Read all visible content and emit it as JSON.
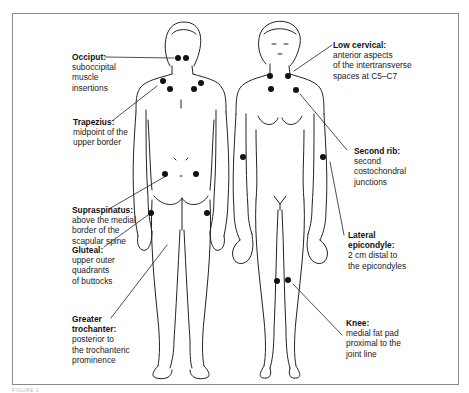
{
  "figure": {
    "caption": "FIGURE 1",
    "views": [
      "posterior",
      "anterior"
    ],
    "accent_color": "#111111",
    "frame_color": "#8a8a8a"
  },
  "labels": {
    "occiput": {
      "title": "Occiput:",
      "lines": [
        "suboccipital",
        "muscle",
        "insertions"
      ]
    },
    "trapezius": {
      "title": "Trapezius:",
      "lines": [
        "midpoint of the",
        "upper border"
      ]
    },
    "supraspinatus": {
      "title": "Supraspinatus:",
      "lines": [
        "above the medial",
        "border of the",
        "scapular spine"
      ]
    },
    "gluteal": {
      "title": "Gluteal:",
      "lines": [
        "upper outer",
        "quadrants",
        "of buttocks"
      ]
    },
    "greater_trochanter": {
      "title": "Greater trochanter:",
      "title_lines": [
        "Greater",
        "trochanter:"
      ],
      "lines": [
        "posterior to",
        "the trochanteric",
        "prominence"
      ]
    },
    "low_cervical": {
      "title": "Low cervical:",
      "lines": [
        "anterior aspects",
        "of the intertransverse",
        "spaces at C5–C7"
      ]
    },
    "second_rib": {
      "title": "Second rib:",
      "lines": [
        "second",
        "costochondral",
        "junctions"
      ]
    },
    "lateral_epicondyle": {
      "title": "Lateral epicondyle:",
      "title_lines": [
        "Lateral",
        "epicondyle:"
      ],
      "lines": [
        "2 cm distal to",
        "the epicondyles"
      ]
    },
    "knee": {
      "title": "Knee:",
      "lines": [
        "medial fat pad",
        "proximal  to the",
        "joint line"
      ]
    }
  },
  "tender_points": {
    "posterior": [
      {
        "name": "occiput-left",
        "x": 178,
        "y": 58
      },
      {
        "name": "occiput-right",
        "x": 186,
        "y": 58
      },
      {
        "name": "trapezius-left",
        "x": 163,
        "y": 81
      },
      {
        "name": "trapezius-right",
        "x": 201,
        "y": 83
      },
      {
        "name": "supraspinatus-left",
        "x": 170,
        "y": 89
      },
      {
        "name": "supraspinatus-right",
        "x": 194,
        "y": 89
      },
      {
        "name": "gluteal-left",
        "x": 165,
        "y": 174
      },
      {
        "name": "gluteal-right",
        "x": 196,
        "y": 174
      },
      {
        "name": "trochanter-left",
        "x": 151,
        "y": 213
      },
      {
        "name": "trochanter-right",
        "x": 207,
        "y": 213
      }
    ],
    "anterior": [
      {
        "name": "low-cervical-left",
        "x": 270,
        "y": 76
      },
      {
        "name": "low-cervical-right",
        "x": 288,
        "y": 76
      },
      {
        "name": "second-rib-left",
        "x": 271,
        "y": 89
      },
      {
        "name": "second-rib-right",
        "x": 296,
        "y": 90
      },
      {
        "name": "lateral-epicondyle-left",
        "x": 243,
        "y": 157
      },
      {
        "name": "lateral-epicondyle-right",
        "x": 323,
        "y": 157
      },
      {
        "name": "knee-left",
        "x": 277,
        "y": 281
      },
      {
        "name": "knee-right",
        "x": 288,
        "y": 280
      }
    ]
  }
}
